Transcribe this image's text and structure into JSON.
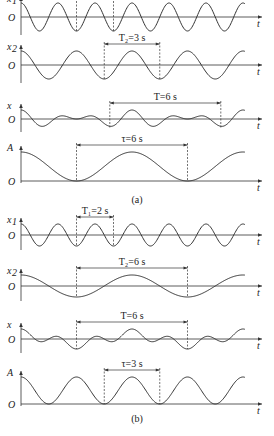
{
  "figure": {
    "panels": [
      {
        "caption": "(a)",
        "plots": [
          {
            "id": "a1",
            "ylabel": "x",
            "ylabel_sub": "1",
            "origin": "O",
            "xlabel": "t",
            "kind": "cos",
            "period": 2,
            "annotation": {
              "text": "T₁=2 s",
              "t_start": 3,
              "t_end": 5
            }
          },
          {
            "id": "a2",
            "ylabel": "x",
            "ylabel_sub": "2",
            "origin": "O",
            "xlabel": "t",
            "kind": "cos",
            "period": 3,
            "annotation": {
              "text": "T₂=3 s",
              "t_start": 4.5,
              "t_end": 7.5
            }
          },
          {
            "id": "a3",
            "ylabel": "x",
            "ylabel_sub": "",
            "origin": "O",
            "xlabel": "t",
            "kind": "sum",
            "periods": [
              2,
              3
            ],
            "annotation": {
              "text": "T=6 s",
              "t_start": 4.8,
              "t_end": 10.8
            }
          },
          {
            "id": "a4",
            "ylabel": "A",
            "ylabel_sub": "",
            "origin": "O",
            "xlabel": "t",
            "kind": "envelope",
            "period": 6,
            "annotation": {
              "text": "τ=6 s",
              "t_start": 3,
              "t_end": 9
            }
          }
        ]
      },
      {
        "caption": "(b)",
        "plots": [
          {
            "id": "b1",
            "ylabel": "x",
            "ylabel_sub": "1",
            "origin": "O",
            "xlabel": "t",
            "kind": "cos",
            "period": 2,
            "annotation": {
              "text": "T₁=2 s",
              "t_start": 3,
              "t_end": 5
            }
          },
          {
            "id": "b2",
            "ylabel": "x",
            "ylabel_sub": "2",
            "origin": "O",
            "xlabel": "t",
            "kind": "cos",
            "period": 6,
            "annotation": {
              "text": "T₂=6 s",
              "t_start": 3,
              "t_end": 9
            }
          },
          {
            "id": "b3",
            "ylabel": "x",
            "ylabel_sub": "",
            "origin": "O",
            "xlabel": "t",
            "kind": "sum",
            "periods": [
              2,
              6
            ],
            "annotation": {
              "text": "T=6 s",
              "t_start": 3,
              "t_end": 9
            }
          },
          {
            "id": "b4",
            "ylabel": "A",
            "ylabel_sub": "",
            "origin": "O",
            "xlabel": "t",
            "kind": "envelope",
            "period": 3,
            "annotation": {
              "text": "τ=3 s",
              "t_start": 4.5,
              "t_end": 7.5
            }
          }
        ]
      }
    ]
  },
  "captions": {
    "a": "(a)",
    "b": "(b)"
  }
}
